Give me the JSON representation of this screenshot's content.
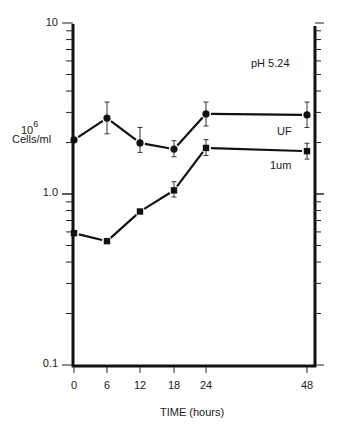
{
  "chart_data": {
    "type": "line",
    "title": "",
    "annotation": "pH 5.24",
    "xlabel": "TIME (hours)",
    "ylabel_exponent_base": "10",
    "ylabel_exponent": "6",
    "ylabel_unit": "Cells/ml",
    "yscale": "log",
    "ylim": [
      0.1,
      10
    ],
    "y_tick_labels": [
      "10",
      "1.0",
      "0.1"
    ],
    "x": [
      0,
      6,
      12,
      18,
      24,
      48
    ],
    "x_tick_labels": [
      "0",
      "6",
      "12",
      "18",
      "24",
      "48"
    ],
    "xlim": [
      0,
      50
    ],
    "grid": false,
    "legend_position": "inline labels on right",
    "series": [
      {
        "name": "UF",
        "marker": "circle",
        "values": [
          2.07,
          2.78,
          1.99,
          1.83,
          2.94,
          2.9
        ],
        "err_low": [
          null,
          2.25,
          1.75,
          1.65,
          2.5,
          2.45
        ],
        "err_high": [
          null,
          3.45,
          2.45,
          2.05,
          3.45,
          3.45
        ]
      },
      {
        "name": "1um",
        "marker": "square",
        "values": [
          0.59,
          0.53,
          0.79,
          1.05,
          1.86,
          1.78
        ],
        "err_low": [
          null,
          null,
          null,
          0.96,
          1.68,
          1.6
        ],
        "err_high": [
          null,
          null,
          null,
          1.18,
          2.08,
          1.98
        ]
      }
    ]
  }
}
